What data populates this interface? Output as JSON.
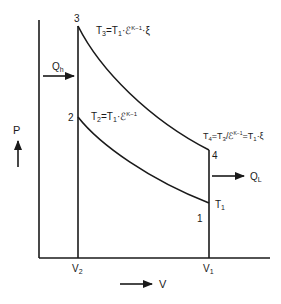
{
  "diagram": {
    "type": "P-V diagram (Otto cycle)",
    "axes": {
      "y_label": "P",
      "x_label": "V"
    },
    "points": {
      "p1": "1",
      "p2": "2",
      "p3": "3",
      "p4": "4"
    },
    "volumes": {
      "v2": "V",
      "v2_sub": "2",
      "v1": "V",
      "v1_sub": "1"
    },
    "heat": {
      "in": "Q",
      "in_sub": "h",
      "out": "Q",
      "out_sub": "L"
    },
    "equations": {
      "t3": {
        "a": "T",
        "a_sub": "3",
        "b": "=T",
        "b_sub": "1",
        "c": "·ℰ",
        "c_sup": "K−1",
        "d": "·ξ"
      },
      "t2": {
        "a": "T",
        "a_sub": "2",
        "b": "=T",
        "b_sub": "1",
        "c": "·ℰ",
        "c_sup": "K−1"
      },
      "t4": {
        "a": "T",
        "a_sub": "4",
        "b": "=T",
        "b_sub": "3",
        "c": "/ℰ",
        "c_sup": "K−1",
        "d": "=T",
        "d_sub": "1",
        "e": "·ξ"
      },
      "t1": {
        "a": "T",
        "a_sub": "1"
      }
    },
    "colors": {
      "line": "#1a1a1a",
      "background": "#ffffff"
    }
  }
}
